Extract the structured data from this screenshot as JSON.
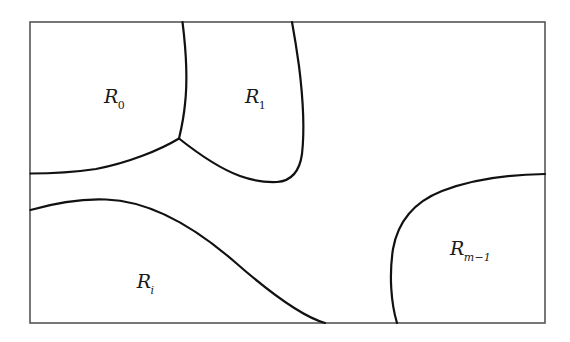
{
  "figure": {
    "type": "region-partition-diagram",
    "background_color": "#ffffff",
    "border_color": "#555555",
    "curve_color": "#111111",
    "border": {
      "x": 30,
      "y": 22,
      "width": 515,
      "height": 301,
      "stroke_width": 1.6
    },
    "regions": [
      {
        "id": "R0",
        "label_script": "R",
        "label_subscript": "0",
        "subscript_style": "number",
        "label_x": 115,
        "label_y": 98,
        "position": "top-left"
      },
      {
        "id": "R1",
        "label_script": "R",
        "label_subscript": "1",
        "subscript_style": "number",
        "label_x": 256,
        "label_y": 98,
        "position": "top-middle"
      },
      {
        "id": "Ri",
        "label_script": "R",
        "label_subscript": "i",
        "subscript_style": "italic",
        "label_x": 146,
        "label_y": 283,
        "position": "bottom-left"
      },
      {
        "id": "Rm1",
        "label_script": "R",
        "label_subscript": "m−1",
        "subscript_style": "italic",
        "label_x": 471,
        "label_y": 250,
        "position": "bottom-right"
      }
    ],
    "curves": [
      {
        "id": "curve-r0-r1",
        "name": "boundary-between-R0-and-R1",
        "from": "top-edge",
        "to": "triple-junction",
        "path": "M 182.5 22 C 186 50 188 78 185 104 C 183.5 120 181 130 179 138.5",
        "stroke_width": 2.2
      },
      {
        "id": "curve-r0-ri",
        "name": "boundary-between-R0-and-lower-area",
        "from": "triple-junction",
        "to": "left-edge",
        "path": "M 179 138.5 C 160 150 128 163 96 169 C 72 172.5 48 173.5 30.5 173.5",
        "stroke_width": 2.2
      },
      {
        "id": "curve-r1-bottom",
        "name": "boundary-bottom-of-R1",
        "from": "triple-junction",
        "to": "u-bottom",
        "path": "M 179 138.5 C 196 152 218 168 240 176 C 254 181 266 182.5 277 182",
        "stroke_width": 2.2
      },
      {
        "id": "curve-r1-right",
        "name": "boundary-right-of-R1",
        "from": "u-bottom",
        "to": "top-edge",
        "path": "M 277 182 C 291 181 299.5 172 302 154 C 304.5 132 303 98 299 66 C 296.5 48 294 33 292 22",
        "stroke_width": 2.2
      },
      {
        "id": "curve-ri-top",
        "name": "boundary-top-of-Ri",
        "from": "left-edge",
        "to": "bottom-edge",
        "path": "M 30.5 210 C 55 203 82 198.5 106 199.5 C 150 201 196 228 236 263 C 268 291 300 316 325 323",
        "stroke_width": 2.2
      },
      {
        "id": "curve-rm1",
        "name": "boundary-of-Rm-minus-1",
        "from": "right-edge",
        "to": "bottom-edge",
        "path": "M 545 174 C 505 174.5 470 180 442 191 C 414 202 398 221 393 249 C 389 275 391 303 397 323",
        "stroke_width": 2.2
      }
    ]
  }
}
